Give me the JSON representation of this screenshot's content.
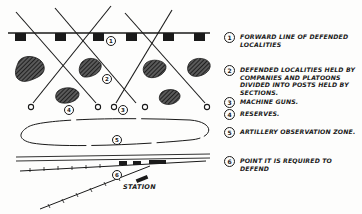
{
  "diagram": {
    "title": "",
    "colors": {
      "ink": "#1a1a1a",
      "paper": "#fdfdfc"
    },
    "map_labels": {
      "forward_line_marker": "1",
      "locality_marker_a": "2",
      "locality_marker_b": "4",
      "mg_marker": "3",
      "obs_zone_marker": "5",
      "station_marker": "6",
      "station": "STATION"
    },
    "legend": [
      {
        "num": "1",
        "text": "FORWARD LINE OF DEFENDED\nLOCALITIES"
      },
      {
        "num": "2",
        "text": "DEFENDED LOCALITIES HELD BY\nCOMPANIES AND PLATOONS\nDIVIDED INTO POSTS HELD BY\nSECTIONS."
      },
      {
        "num": "3",
        "text": "MACHINE GUNS."
      },
      {
        "num": "4",
        "text": "RESERVES."
      },
      {
        "num": "5",
        "text": "ARTILLERY OBSERVATION ZONE."
      },
      {
        "num": "6",
        "text": "POINT IT IS REQUIRED TO DEFEND"
      }
    ]
  }
}
